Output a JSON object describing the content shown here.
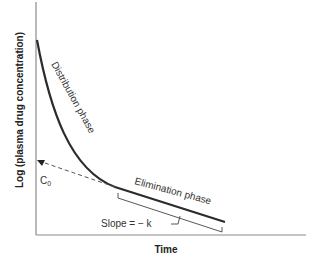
{
  "diagram": {
    "type": "pharmacokinetic-log-concentration-time-curve",
    "ylabel": "Log (plasma drug concentration)",
    "xlabel": "Time",
    "labels": {
      "distribution": "Distribution phase",
      "elimination": "Elimination phase",
      "intercept_main": "C",
      "intercept_sub": "0",
      "slope": "Slope = − k"
    },
    "colors": {
      "axis": "#888888",
      "curve": "#2b2b2b",
      "dashed": "#555555",
      "text": "#333333"
    }
  }
}
